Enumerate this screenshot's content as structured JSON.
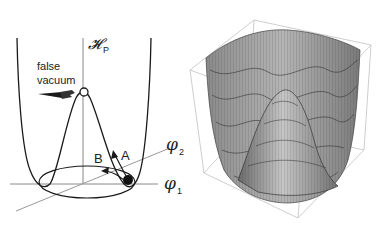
{
  "figure": {
    "left": {
      "axis_vertical_label": "𝓗",
      "axis_vertical_subscript": "P",
      "axis_phi1_label": "φ",
      "axis_phi1_subscript": "1",
      "axis_phi2_label": "φ",
      "axis_phi2_subscript": "2",
      "false_vacuum_label_line1": "false",
      "false_vacuum_label_line2": "vacuum",
      "path_a_label": "A",
      "path_b_label": "B"
    },
    "right": {
      "description": "3D mesh surface plot of Mexican-hat potential in bounding box"
    },
    "colors": {
      "line": "#1a1a1a",
      "axis": "#777777",
      "box": "#bbbbbb",
      "surface_light": "#b8b8b8",
      "surface_dark": "#555555"
    }
  }
}
